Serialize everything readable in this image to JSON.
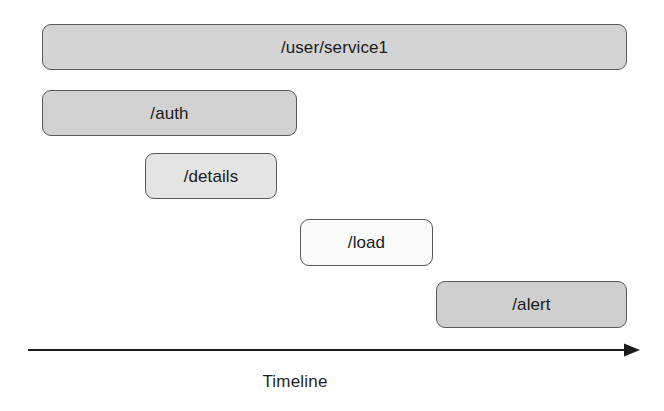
{
  "diagram": {
    "type": "span-timeline",
    "background_color": "#ffffff",
    "border_color": "#58595b",
    "text_color": "#1b1b1b"
  },
  "spans": [
    {
      "label": "/user/service1",
      "fill_color": "#d4d4d4",
      "start_px": 42,
      "end_px": 627,
      "row": 1
    },
    {
      "label": "/auth",
      "fill_color": "#d2d2d2",
      "start_px": 42,
      "end_px": 297,
      "row": 2
    },
    {
      "label": "/details",
      "fill_color": "#e4e4e4",
      "start_px": 145,
      "end_px": 277,
      "row": 3
    },
    {
      "label": "/load",
      "fill_color": "#fafafa",
      "start_px": 300,
      "end_px": 433,
      "row": 4
    },
    {
      "label": "/alert",
      "fill_color": "#cfcfcf",
      "start_px": 436,
      "end_px": 627,
      "row": 5
    }
  ],
  "axis": {
    "caption": "Timeline",
    "arrow_direction": "right",
    "line_color": "#1c1c1c",
    "start_px": 28,
    "end_px": 640
  },
  "chart_data": {
    "type": "bar",
    "title": "",
    "xlabel": "Timeline",
    "ylabel": "",
    "orientation": "horizontal",
    "categories": [
      "/user/service1",
      "/auth",
      "/details",
      "/load",
      "/alert"
    ],
    "series": [
      {
        "name": "span start",
        "values": [
          42,
          42,
          145,
          300,
          436
        ]
      },
      {
        "name": "span end",
        "values": [
          627,
          297,
          277,
          433,
          627
        ]
      },
      {
        "name": "span duration",
        "values": [
          585,
          255,
          132,
          133,
          191
        ]
      }
    ],
    "xlim": [
      28,
      640
    ],
    "grid": false,
    "legend": "none",
    "annotations": [
      "Timeline"
    ]
  }
}
